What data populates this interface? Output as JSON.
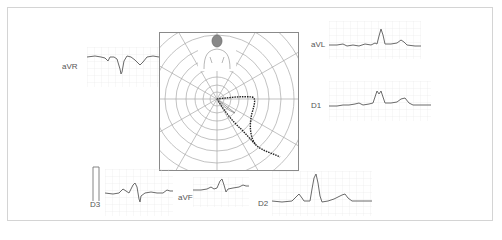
{
  "diagram": {
    "title": "",
    "leads": [
      {
        "id": "aVR",
        "label": "aVR"
      },
      {
        "id": "aVL",
        "label": "aVL"
      },
      {
        "id": "D1",
        "label": "D1"
      },
      {
        "id": "D3",
        "label": "D3"
      },
      {
        "id": "aVF",
        "label": "aVF"
      },
      {
        "id": "D2",
        "label": "D2"
      }
    ],
    "polar": {
      "rings": 9,
      "spokes": 12,
      "figure": "human-torso-icon",
      "vector_loop_color": "#222222"
    },
    "colors": {
      "grid_line": "#e6e6e6",
      "trace": "#6a6a6a",
      "polar_line": "#9a9a9a",
      "frame_border": "#d4d4d4"
    }
  }
}
